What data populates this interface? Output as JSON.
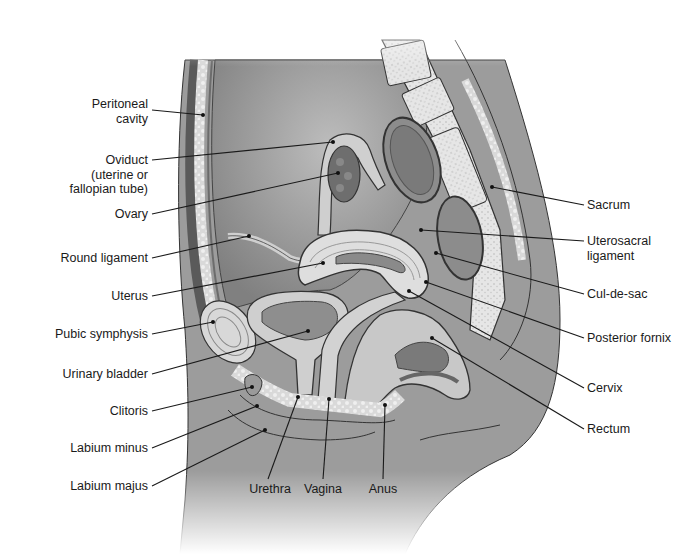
{
  "figure": {
    "colors": {
      "background": "#ffffff",
      "body_fill": "#9a9a9a",
      "cavity_fill": "#8a8a8a",
      "organ_light": "#d6d6d6",
      "bone_fill": "#e4e4e4",
      "line": "#222222",
      "text": "#1a1a1a"
    }
  },
  "labels_left": [
    {
      "id": "peritoneal-cavity",
      "lines": [
        "Peritoneal",
        "cavity"
      ],
      "text_x": 148,
      "text_y": 104,
      "line_from": [
        152,
        110
      ],
      "dot": [
        203,
        115
      ]
    },
    {
      "id": "oviduct",
      "lines": [
        "Oviduct",
        "(uterine or",
        "fallopian tube)"
      ],
      "text_x": 148,
      "text_y": 154,
      "line_from": [
        152,
        160
      ],
      "dot": [
        333,
        142
      ]
    },
    {
      "id": "ovary",
      "lines": [
        "Ovary"
      ],
      "text_x": 148,
      "text_y": 208,
      "line_from": [
        152,
        214
      ],
      "dot": [
        338,
        173
      ]
    },
    {
      "id": "round-ligament",
      "lines": [
        "Round ligament"
      ],
      "text_x": 148,
      "text_y": 252,
      "line_from": [
        152,
        258
      ],
      "dot": [
        249,
        236
      ]
    },
    {
      "id": "uterus",
      "lines": [
        "Uterus"
      ],
      "text_x": 148,
      "text_y": 290,
      "line_from": [
        152,
        296
      ],
      "dot": [
        323,
        263
      ]
    },
    {
      "id": "pubic-symphysis",
      "lines": [
        "Pubic symphysis"
      ],
      "text_x": 148,
      "text_y": 328,
      "line_from": [
        152,
        334
      ],
      "dot": [
        213,
        322
      ]
    },
    {
      "id": "urinary-bladder",
      "lines": [
        "Urinary bladder"
      ],
      "text_x": 148,
      "text_y": 368,
      "line_from": [
        152,
        374
      ],
      "dot": [
        308,
        331
      ]
    },
    {
      "id": "clitoris",
      "lines": [
        "Clitoris"
      ],
      "text_x": 148,
      "text_y": 405,
      "line_from": [
        152,
        411
      ],
      "dot": [
        252,
        387
      ]
    },
    {
      "id": "labium-minus",
      "lines": [
        "Labium minus"
      ],
      "text_x": 148,
      "text_y": 442,
      "line_from": [
        152,
        448
      ],
      "dot": [
        257,
        406
      ]
    },
    {
      "id": "labium-majus",
      "lines": [
        "Labium majus"
      ],
      "text_x": 148,
      "text_y": 480,
      "line_from": [
        152,
        486
      ],
      "dot": [
        265,
        430
      ]
    }
  ],
  "labels_right": [
    {
      "id": "sacrum",
      "lines": [
        "Sacrum"
      ],
      "text_x": 587,
      "text_y": 199,
      "line_from": [
        584,
        205
      ],
      "dot": [
        492,
        187
      ]
    },
    {
      "id": "uterosacral-ligament",
      "lines": [
        "Uterosacral",
        "ligament"
      ],
      "text_x": 587,
      "text_y": 235,
      "line_from": [
        584,
        241
      ],
      "dot": [
        421,
        230
      ]
    },
    {
      "id": "cul-de-sac",
      "lines": [
        "Cul-de-sac"
      ],
      "text_x": 587,
      "text_y": 288,
      "line_from": [
        584,
        294
      ],
      "dot": [
        436,
        253
      ]
    },
    {
      "id": "posterior-fornix",
      "lines": [
        "Posterior fornix"
      ],
      "text_x": 587,
      "text_y": 332,
      "line_from": [
        584,
        338
      ],
      "dot": [
        426,
        282
      ]
    },
    {
      "id": "cervix",
      "lines": [
        "Cervix"
      ],
      "text_x": 587,
      "text_y": 382,
      "line_from": [
        584,
        388
      ],
      "dot": [
        409,
        291
      ]
    },
    {
      "id": "rectum",
      "lines": [
        "Rectum"
      ],
      "text_x": 587,
      "text_y": 423,
      "line_from": [
        584,
        429
      ],
      "dot": [
        432,
        338
      ]
    }
  ],
  "labels_bottom": [
    {
      "id": "urethra",
      "lines": [
        "Urethra"
      ],
      "text_cx": 270,
      "text_y": 482,
      "line_from": [
        268,
        479
      ],
      "dot": [
        298,
        397
      ]
    },
    {
      "id": "vagina",
      "lines": [
        "Vagina"
      ],
      "text_cx": 323,
      "text_y": 482,
      "line_from": [
        323,
        479
      ],
      "dot": [
        329,
        399
      ]
    },
    {
      "id": "anus",
      "lines": [
        "Anus"
      ],
      "text_cx": 383,
      "text_y": 482,
      "line_from": [
        383,
        479
      ],
      "dot": [
        385,
        405
      ]
    }
  ]
}
